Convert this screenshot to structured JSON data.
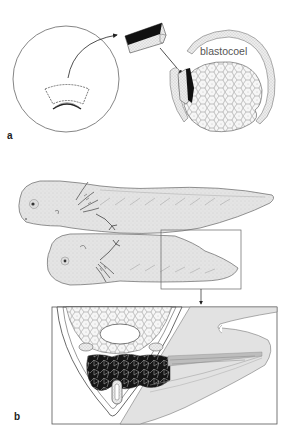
{
  "figure": {
    "panels": [
      {
        "id": "a",
        "label": "a",
        "annotations": [
          "blastocoel"
        ],
        "elements": [
          "whole-embryo-circle",
          "excised-tissue-fragment",
          "transplanted-tissue-block",
          "host-blastula-section"
        ]
      },
      {
        "id": "b",
        "label": "b",
        "elements": [
          "conjoined-larvae",
          "inset-box",
          "enlarged-cross-section"
        ]
      }
    ]
  },
  "labels": {
    "panel_a": "a",
    "panel_b": "b",
    "blastocoel": "blastocoel"
  },
  "colors": {
    "line": "#555555",
    "fill_light": "#e9e9e9",
    "fill_body": "#e2e2e2",
    "dark_tissue": "#111111",
    "background": "#ffffff"
  }
}
